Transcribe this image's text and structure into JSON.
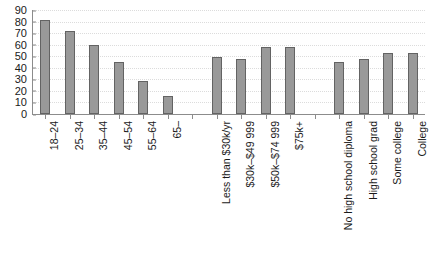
{
  "chart_data": {
    "type": "bar",
    "title": "",
    "subtitle": "",
    "xlabel": "",
    "ylabel": "",
    "ylim": [
      0,
      90
    ],
    "ytick_step": 10,
    "yticks": [
      0,
      10,
      20,
      30,
      40,
      50,
      60,
      70,
      80,
      90
    ],
    "grid": true,
    "grid_orientation": "horizontal",
    "grid_style": "dotted",
    "legend": "none",
    "bar_color": "#999999",
    "bar_border_color": "#636363",
    "axis_color": "#8c8c8c",
    "gridline_color": "#dcdcdc",
    "text_color": "#1a1a1a",
    "categories": [
      "18–24",
      "25–34",
      "35–44",
      "45–54",
      "55–64",
      "65–",
      "Less than $30k/yr",
      "$30k–$49 999",
      "$50k–$74 999",
      "$75k+",
      "No high school diploma",
      "High school grad",
      "Some college",
      "College"
    ],
    "values": [
      81,
      72,
      60,
      45,
      29,
      16,
      49,
      48,
      58,
      58,
      45,
      48,
      53,
      53
    ],
    "groups": [
      {
        "name": "Age",
        "categories": [
          "18–24",
          "25–34",
          "35–44",
          "45–54",
          "55–64",
          "65–"
        ],
        "values": [
          81,
          72,
          60,
          45,
          29,
          16
        ]
      },
      {
        "name": "Household income",
        "categories": [
          "Less than $30k/yr",
          "$30k–$49 999",
          "$50k–$74 999",
          "$75k+"
        ],
        "values": [
          49,
          48,
          58,
          58
        ]
      },
      {
        "name": "Education",
        "categories": [
          "No high school diploma",
          "High school grad",
          "Some college",
          "College"
        ],
        "values": [
          45,
          48,
          53,
          53
        ]
      }
    ],
    "bars": [
      {
        "label": "18–24",
        "value": 81,
        "group": "Age",
        "slot": 0
      },
      {
        "label": "25–34",
        "value": 72,
        "group": "Age",
        "slot": 1
      },
      {
        "label": "35–44",
        "value": 60,
        "group": "Age",
        "slot": 2
      },
      {
        "label": "45–54",
        "value": 45,
        "group": "Age",
        "slot": 3
      },
      {
        "label": "55–64",
        "value": 29,
        "group": "Age",
        "slot": 4
      },
      {
        "label": "65–",
        "value": 16,
        "group": "Age",
        "slot": 5
      },
      {
        "label": "Less than $30k/yr",
        "value": 49,
        "group": "Household income",
        "slot": 7
      },
      {
        "label": "$30k–$49 999",
        "value": 48,
        "group": "Household income",
        "slot": 8
      },
      {
        "label": "$50k–$74 999",
        "value": 58,
        "group": "Household income",
        "slot": 9
      },
      {
        "label": "$75k+",
        "value": 58,
        "group": "Household income",
        "slot": 10
      },
      {
        "label": "No high school diploma",
        "value": 45,
        "group": "Education",
        "slot": 12
      },
      {
        "label": "High school grad",
        "value": 48,
        "group": "Education",
        "slot": 13
      },
      {
        "label": "Some college",
        "value": 53,
        "group": "Education",
        "slot": 14
      },
      {
        "label": "College",
        "value": 53,
        "group": "Education",
        "slot": 15
      }
    ]
  }
}
